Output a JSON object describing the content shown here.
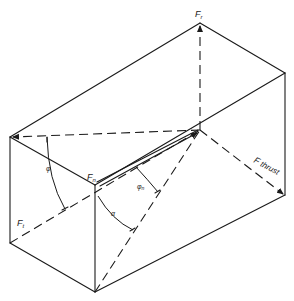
{
  "diagram": {
    "type": "force-resolution-box",
    "labels": {
      "f_r": {
        "main": "F",
        "sub": "r"
      },
      "f_n": {
        "main": "F",
        "sub": "n"
      },
      "f_t": {
        "main": "F",
        "sub": "t"
      },
      "f_thrust": {
        "main": "F",
        "suffix": " thrust"
      },
      "phi": "φ",
      "phi_n": {
        "main": "φ",
        "sub": "n"
      },
      "alpha": "α"
    }
  }
}
